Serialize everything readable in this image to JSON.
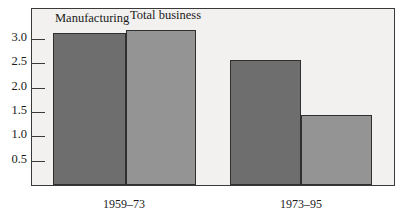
{
  "chart_data": {
    "type": "bar",
    "title": "",
    "subtitle": "",
    "xlabel": "",
    "ylabel": "",
    "categories": [
      "1959–73",
      "1973–95"
    ],
    "series": [
      {
        "name": "Manufacturing",
        "values": [
          3.12,
          2.56
        ],
        "color": "#6e6e6e"
      },
      {
        "name": "Total business",
        "values": [
          3.18,
          1.43
        ],
        "color": "#949494"
      }
    ],
    "ylim": [
      0.0,
      3.35
    ],
    "yticks": [
      "0.5",
      "1.0",
      "1.5",
      "2.0",
      "2.5",
      "3.0"
    ],
    "ytick_values": [
      0.5,
      1.0,
      1.5,
      2.0,
      2.5,
      3.0
    ],
    "grid": false,
    "legend_position": "above-first-group",
    "plot_background": "#f2f1ef",
    "frame_color": "#3a3a3a"
  },
  "legend": {
    "items": [
      {
        "label": "Manufacturing"
      },
      {
        "label": "Total business"
      }
    ]
  }
}
